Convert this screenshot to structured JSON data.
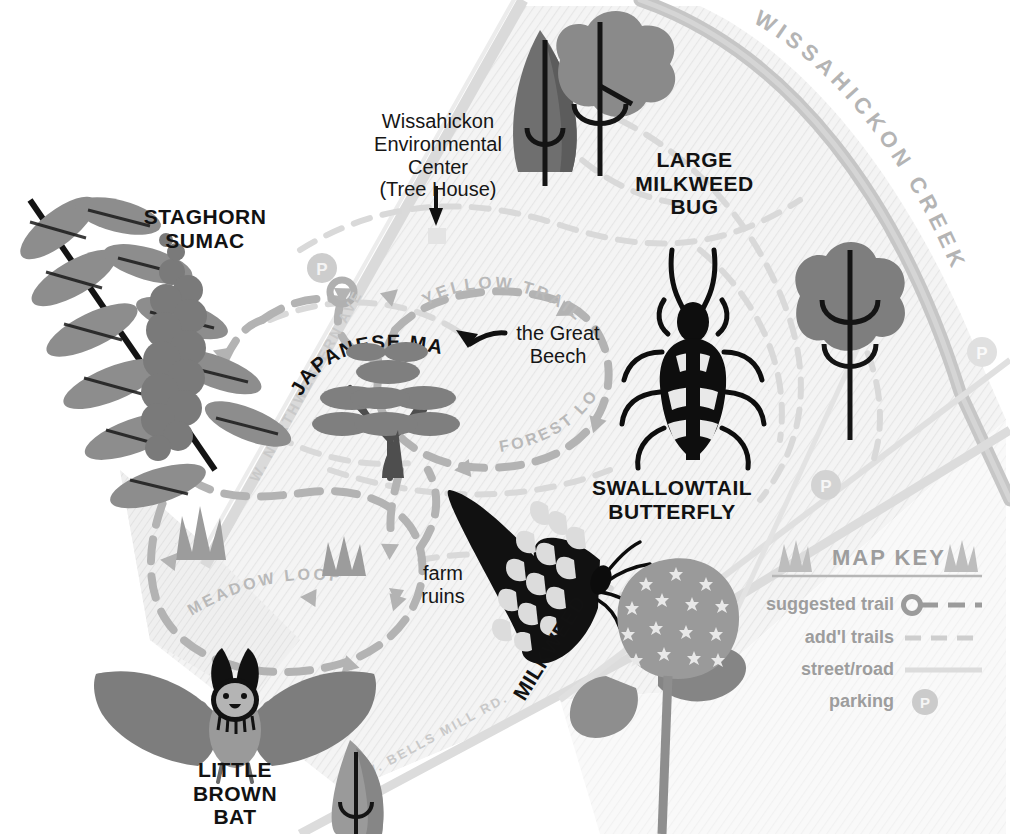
{
  "map": {
    "title_implicit": "Wissahickon Environmental Center Park Map",
    "place_labels": {
      "environmental_center": "Wissahickon\nEnvironmental\nCenter\n(Tree House)",
      "great_beech": "the Great\nBeech",
      "farm_ruins": "farm\nruins"
    },
    "trails": [
      {
        "name": "YELLOW TRAIL",
        "kind": "suggested"
      },
      {
        "name": "FOREST LOOP",
        "kind": "suggested"
      },
      {
        "name": "MEADOW LOOP",
        "kind": "suggested"
      }
    ],
    "roads": [
      {
        "name": "W. NORTHWESTERN AVE"
      },
      {
        "name": "W. BELLS MILL RD."
      }
    ],
    "water": [
      {
        "name": "WISSAHICKON CREEK"
      }
    ],
    "parking_markers": [
      {
        "id": "p-northwest",
        "glyph": "P"
      },
      {
        "id": "p-east-upper",
        "glyph": "P"
      },
      {
        "id": "p-east-mid",
        "glyph": "P"
      },
      {
        "id": "p-east-lower",
        "glyph": "P"
      }
    ]
  },
  "specimens": [
    {
      "id": "staghorn-sumac",
      "label": "STAGHORN\nSUMAC"
    },
    {
      "id": "large-milkweed-bug",
      "label": "LARGE\nMILKWEED\nBUG"
    },
    {
      "id": "japanese-maple",
      "label": "JAPANESE MAPLE"
    },
    {
      "id": "swallowtail-butterfly",
      "label": "SWALLOWTAIL\nBUTTERFLY"
    },
    {
      "id": "little-brown-bat",
      "label": "LITTLE\nBROWN\nBAT"
    },
    {
      "id": "milkweed",
      "label": "MILKWEED"
    }
  ],
  "key": {
    "title": "MAP KEY",
    "entries": [
      {
        "label": "suggested trail",
        "symbol": "circle-dashed-line"
      },
      {
        "label": "add'l trails",
        "symbol": "dashed-line"
      },
      {
        "label": "street/road",
        "symbol": "solid-line"
      },
      {
        "label": "parking",
        "symbol": "p-circle"
      }
    ]
  },
  "colors": {
    "paper": "#ffffff",
    "map_fill": "#f2f2f2",
    "map_edge": "#d8d8d8",
    "trail_gray": "#b8b8b8",
    "road_gray": "#cfcfcf",
    "creek_gray": "#bdbdbd",
    "ink": "#151515",
    "mid_gray": "#8e8e8e",
    "dark_gray": "#6e6e6e",
    "key_gray": "#a0a0a0"
  }
}
